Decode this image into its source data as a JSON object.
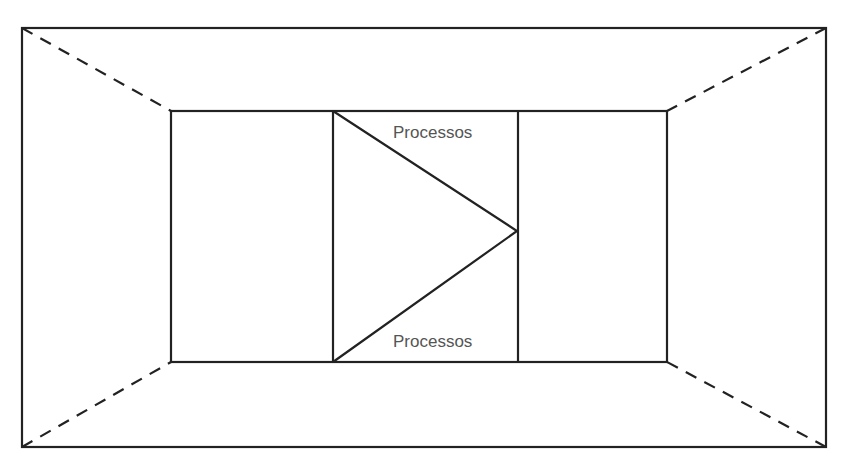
{
  "diagram": {
    "type": "perspective-box-with-process-arrow",
    "labels": {
      "top": "Processos",
      "bottom": "Processos"
    },
    "colors": {
      "stroke": "#222222",
      "text": "#555555",
      "background": "#ffffff"
    },
    "shapes": {
      "outer_rect": {
        "x1": 22,
        "y1": 28,
        "x2": 826,
        "y2": 447
      },
      "inner_rect": {
        "x1": 171,
        "y1": 111,
        "x2": 667,
        "y2": 362
      },
      "divider_left_x": 333,
      "divider_right_x": 518,
      "triangle": {
        "top": [
          333,
          111
        ],
        "bottom": [
          333,
          362
        ],
        "apex": [
          517,
          231
        ]
      },
      "dashed_connectors": [
        {
          "from": [
            22,
            28
          ],
          "to": [
            171,
            111
          ]
        },
        {
          "from": [
            826,
            28
          ],
          "to": [
            667,
            111
          ]
        },
        {
          "from": [
            22,
            447
          ],
          "to": [
            171,
            362
          ]
        },
        {
          "from": [
            826,
            447
          ],
          "to": [
            667,
            362
          ]
        }
      ]
    }
  }
}
